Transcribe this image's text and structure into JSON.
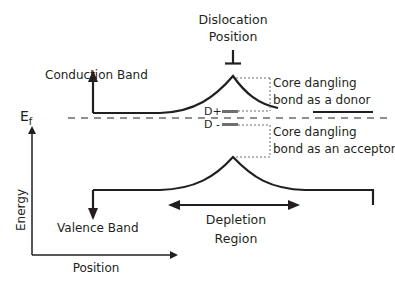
{
  "diagram": {
    "title_line1": "Dislocation",
    "title_line2": "Position",
    "dislocation_symbol": "⊥",
    "conduction_band_label": "Conduction Band",
    "valence_band_label": "Valence Band",
    "fermi_label_main": "E",
    "fermi_label_sub": "f",
    "donor_level_label": "D+",
    "acceptor_level_label": "D -",
    "donor_annotation_line1": "Core dangling",
    "donor_annotation_line2": "bond as a donor",
    "acceptor_annotation_line1": "Core dangling",
    "acceptor_annotation_line2": "bond as an acceptor",
    "depletion_line1": "Depletion",
    "depletion_line2": "Region",
    "y_axis_label": "Energy",
    "x_axis_label": "Position"
  },
  "colors": {
    "ink": "#231f20",
    "level_bar": "#6d6e71",
    "dotted": "#6d6e71"
  }
}
